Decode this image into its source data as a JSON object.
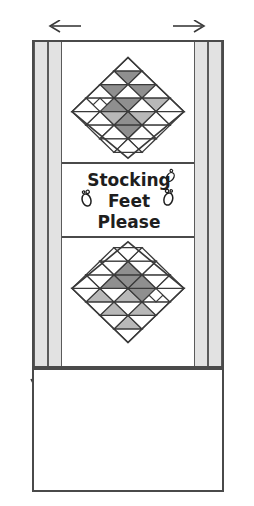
{
  "diagram": {
    "type": "quilt-pattern-schematic",
    "sign_text": {
      "line1": "Stocking",
      "line2": "Feet",
      "line3": "Please",
      "full": "Stocking Feet Please",
      "foot_glyph_left": "footprint-icon",
      "foot_glyph_right": "footprint-icon"
    },
    "annotations": {
      "arrow_left": "←",
      "arrow_right": "→",
      "arrow_down_left": "↓",
      "arrow_down_right": "↓"
    },
    "colors": {
      "outline": "#4a4a4a",
      "strip_fill": "#e2e2e2",
      "dark_patch": "#8f8f8f",
      "mid_patch": "#b8b8b8",
      "light_patch": "#ffffff",
      "background": "#ffffff"
    },
    "borders": {
      "left_strips": 2,
      "right_strips": 2,
      "strip_label": "vertical border strip"
    },
    "blocks": [
      {
        "name": "upper-diamond-block",
        "orientation": "point-up-grid",
        "rows": 5
      },
      {
        "name": "lower-diamond-block",
        "orientation": "point-down-grid",
        "rows": 5
      }
    ],
    "plain_panel": {
      "name": "plain-backing-rectangle",
      "fill": "#ffffff"
    }
  }
}
